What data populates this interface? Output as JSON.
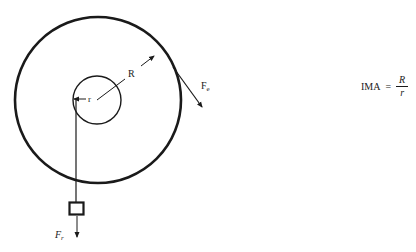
{
  "diagram": {
    "type": "wheel-and-axle",
    "outer_wheel": {
      "label": "R",
      "center": [
        98,
        100
      ],
      "radius": 83
    },
    "inner_axle": {
      "label": "r",
      "center": [
        97,
        100
      ],
      "radius": 24
    },
    "forces": {
      "effort": {
        "label_main": "F",
        "label_sub": "e"
      },
      "resistance": {
        "label_main": "F",
        "label_sub": "r"
      }
    },
    "colors": {
      "stroke": "#1a1a1a",
      "background": "#ffffff"
    }
  },
  "formula": {
    "lhs": "IMA",
    "equals": "=",
    "numerator": "R",
    "denominator": "r"
  }
}
